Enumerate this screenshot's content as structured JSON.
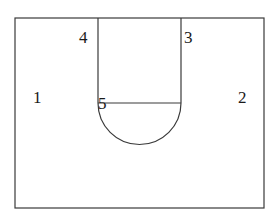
{
  "diagram": {
    "type": "geometric-line-diagram",
    "background_color": "#ffffff",
    "stroke_color": "#3a3a3a",
    "label_color": "#1a1a1a",
    "stroke_width": 1.2,
    "outer_rectangle": {
      "name": "outer-boundary",
      "x": 15,
      "y": 18,
      "width": 249,
      "height": 190
    },
    "left_vertical_line": {
      "name": "left-channel-wall",
      "x1": 98,
      "y1": 18,
      "x2": 98,
      "y2": 103
    },
    "right_vertical_line": {
      "name": "right-channel-wall",
      "x1": 181,
      "y1": 18,
      "x2": 181,
      "y2": 103
    },
    "horizontal_chord": {
      "name": "diameter-chord",
      "x1": 98,
      "y1": 103,
      "x2": 181,
      "y2": 103
    },
    "semicircle": {
      "name": "lower-semicircle",
      "center_x": 139.5,
      "center_y": 103,
      "radius": 41.5,
      "opens": "downward",
      "bottom_y": 144.5
    },
    "labels": [
      {
        "id": "1",
        "text": "1",
        "x": 33,
        "y": 89,
        "region": "left-outer-region"
      },
      {
        "id": "2",
        "text": "2",
        "x": 238,
        "y": 89,
        "region": "right-outer-region"
      },
      {
        "id": "3",
        "text": "3",
        "x": 184,
        "y": 29,
        "region": "right-of-right-wall"
      },
      {
        "id": "4",
        "text": "4",
        "x": 79,
        "y": 29,
        "region": "left-of-left-wall"
      },
      {
        "id": "5",
        "text": "5",
        "x": 98,
        "y": 95,
        "region": "chord-semicircle-junction"
      }
    ]
  }
}
